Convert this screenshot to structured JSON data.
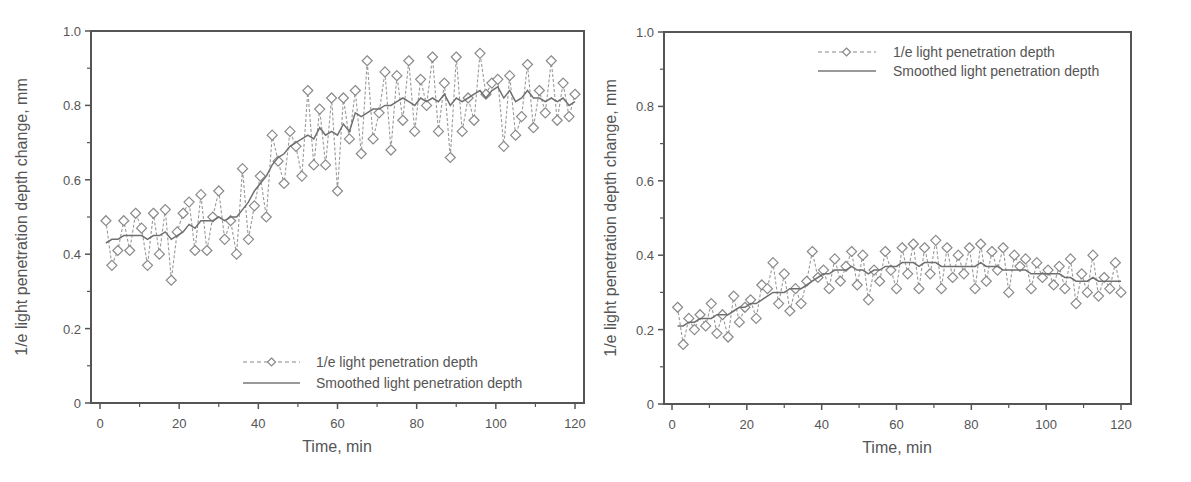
{
  "chart_data": [
    {
      "type": "line",
      "title": "",
      "xlabel": "Time, min",
      "ylabel": "1/e light penetration depth change, mm",
      "xlim": [
        -2,
        122
      ],
      "ylim": [
        0,
        1.0
      ],
      "x_ticks": [
        "0",
        "20",
        "40",
        "60",
        "80",
        "100",
        "120"
      ],
      "y_ticks": [
        "0",
        "0.2",
        "0.4",
        "0.6",
        "0.8",
        "1.0"
      ],
      "grid": false,
      "legend_position": "bottom-right",
      "legend": [
        "1/e light penetration depth",
        "Smoothed light penetration depth"
      ],
      "series": [
        {
          "name": "1/e light penetration depth",
          "style": "dashed-diamond",
          "x": [
            1.5,
            3,
            4.5,
            6,
            7.5,
            9,
            10.5,
            12,
            13.5,
            15,
            16.5,
            18,
            19.5,
            21,
            22.5,
            24,
            25.5,
            27,
            28.5,
            30,
            31.5,
            33,
            34.5,
            36,
            37.5,
            39,
            40.5,
            42,
            43.5,
            45,
            46.5,
            48,
            49.5,
            51,
            52.5,
            54,
            55.5,
            57,
            58.5,
            60,
            61.5,
            63,
            64.5,
            66,
            67.5,
            69,
            70.5,
            72,
            73.5,
            75,
            76.5,
            78,
            79.5,
            81,
            82.5,
            84,
            85.5,
            87,
            88.5,
            90,
            91.5,
            93,
            94.5,
            96,
            97.5,
            99,
            100.5,
            102,
            103.5,
            105,
            106.5,
            108,
            109.5,
            111,
            112.5,
            114,
            115.5,
            117,
            118.5,
            120
          ],
          "values": [
            0.49,
            0.37,
            0.41,
            0.49,
            0.41,
            0.51,
            0.47,
            0.37,
            0.51,
            0.4,
            0.52,
            0.33,
            0.46,
            0.51,
            0.54,
            0.41,
            0.56,
            0.41,
            0.5,
            0.57,
            0.44,
            0.49,
            0.4,
            0.63,
            0.44,
            0.53,
            0.61,
            0.5,
            0.72,
            0.65,
            0.59,
            0.73,
            0.69,
            0.61,
            0.84,
            0.64,
            0.79,
            0.64,
            0.82,
            0.57,
            0.82,
            0.71,
            0.84,
            0.67,
            0.92,
            0.71,
            0.78,
            0.89,
            0.68,
            0.88,
            0.76,
            0.92,
            0.73,
            0.87,
            0.8,
            0.93,
            0.73,
            0.86,
            0.66,
            0.93,
            0.73,
            0.82,
            0.76,
            0.94,
            0.83,
            0.86,
            0.87,
            0.69,
            0.88,
            0.72,
            0.77,
            0.91,
            0.74,
            0.84,
            0.78,
            0.92,
            0.76,
            0.86,
            0.77,
            0.83
          ]
        },
        {
          "name": "Smoothed light penetration depth",
          "style": "solid",
          "x": [
            1.5,
            3,
            4.5,
            6,
            7.5,
            9,
            10.5,
            12,
            13.5,
            15,
            16.5,
            18,
            19.5,
            21,
            22.5,
            24,
            25.5,
            27,
            28.5,
            30,
            31.5,
            33,
            34.5,
            36,
            37.5,
            39,
            40.5,
            42,
            43.5,
            45,
            46.5,
            48,
            49.5,
            51,
            52.5,
            54,
            55.5,
            57,
            58.5,
            60,
            61.5,
            63,
            64.5,
            66,
            67.5,
            69,
            70.5,
            72,
            73.5,
            75,
            76.5,
            78,
            79.5,
            81,
            82.5,
            84,
            85.5,
            87,
            88.5,
            90,
            91.5,
            93,
            94.5,
            96,
            97.5,
            99,
            100.5,
            102,
            103.5,
            105,
            106.5,
            108,
            109.5,
            111,
            112.5,
            114,
            115.5,
            117,
            118.5,
            120
          ],
          "values": [
            0.43,
            0.44,
            0.44,
            0.45,
            0.45,
            0.45,
            0.45,
            0.44,
            0.45,
            0.45,
            0.46,
            0.44,
            0.45,
            0.46,
            0.48,
            0.47,
            0.49,
            0.49,
            0.49,
            0.5,
            0.49,
            0.5,
            0.5,
            0.52,
            0.54,
            0.57,
            0.59,
            0.61,
            0.64,
            0.66,
            0.67,
            0.69,
            0.7,
            0.71,
            0.72,
            0.71,
            0.74,
            0.72,
            0.73,
            0.72,
            0.75,
            0.73,
            0.78,
            0.77,
            0.78,
            0.79,
            0.79,
            0.8,
            0.8,
            0.81,
            0.82,
            0.81,
            0.8,
            0.82,
            0.81,
            0.82,
            0.81,
            0.83,
            0.8,
            0.82,
            0.81,
            0.82,
            0.83,
            0.84,
            0.82,
            0.84,
            0.85,
            0.82,
            0.84,
            0.81,
            0.82,
            0.84,
            0.82,
            0.82,
            0.81,
            0.82,
            0.81,
            0.82,
            0.8,
            0.81
          ]
        }
      ]
    },
    {
      "type": "line",
      "title": "",
      "xlabel": "Time, min",
      "ylabel": "1/e light penetration depth change, mm",
      "xlim": [
        -2,
        122
      ],
      "ylim": [
        0,
        1.0
      ],
      "x_ticks": [
        "0",
        "20",
        "40",
        "60",
        "80",
        "100",
        "120"
      ],
      "y_ticks": [
        "0",
        "0.2",
        "0.4",
        "0.6",
        "0.8",
        "1.0"
      ],
      "grid": false,
      "legend_position": "top-right",
      "legend": [
        "1/e light penetration depth",
        "Smoothed light penetration depth"
      ],
      "series": [
        {
          "name": "1/e light penetration depth",
          "style": "dashed-diamond",
          "x": [
            1.5,
            3,
            4.5,
            6,
            7.5,
            9,
            10.5,
            12,
            13.5,
            15,
            16.5,
            18,
            19.5,
            21,
            22.5,
            24,
            25.5,
            27,
            28.5,
            30,
            31.5,
            33,
            34.5,
            36,
            37.5,
            39,
            40.5,
            42,
            43.5,
            45,
            46.5,
            48,
            49.5,
            51,
            52.5,
            54,
            55.5,
            57,
            58.5,
            60,
            61.5,
            63,
            64.5,
            66,
            67.5,
            69,
            70.5,
            72,
            73.5,
            75,
            76.5,
            78,
            79.5,
            81,
            82.5,
            84,
            85.5,
            87,
            88.5,
            90,
            91.5,
            93,
            94.5,
            96,
            97.5,
            99,
            100.5,
            102,
            103.5,
            105,
            106.5,
            108,
            109.5,
            111,
            112.5,
            114,
            115.5,
            117,
            118.5,
            120
          ],
          "values": [
            0.26,
            0.16,
            0.23,
            0.2,
            0.24,
            0.21,
            0.27,
            0.19,
            0.24,
            0.18,
            0.29,
            0.22,
            0.26,
            0.28,
            0.23,
            0.32,
            0.31,
            0.38,
            0.27,
            0.35,
            0.25,
            0.31,
            0.27,
            0.33,
            0.41,
            0.34,
            0.36,
            0.31,
            0.39,
            0.33,
            0.37,
            0.41,
            0.32,
            0.4,
            0.28,
            0.36,
            0.33,
            0.41,
            0.36,
            0.31,
            0.42,
            0.35,
            0.43,
            0.31,
            0.42,
            0.35,
            0.44,
            0.31,
            0.42,
            0.34,
            0.4,
            0.35,
            0.42,
            0.31,
            0.43,
            0.33,
            0.41,
            0.36,
            0.42,
            0.3,
            0.4,
            0.37,
            0.39,
            0.31,
            0.38,
            0.34,
            0.36,
            0.32,
            0.37,
            0.31,
            0.39,
            0.27,
            0.35,
            0.3,
            0.4,
            0.29,
            0.34,
            0.31,
            0.38,
            0.3
          ]
        },
        {
          "name": "Smoothed light penetration depth",
          "style": "solid",
          "x": [
            1.5,
            3,
            4.5,
            6,
            7.5,
            9,
            10.5,
            12,
            13.5,
            15,
            16.5,
            18,
            19.5,
            21,
            22.5,
            24,
            25.5,
            27,
            28.5,
            30,
            31.5,
            33,
            34.5,
            36,
            37.5,
            39,
            40.5,
            42,
            43.5,
            45,
            46.5,
            48,
            49.5,
            51,
            52.5,
            54,
            55.5,
            57,
            58.5,
            60,
            61.5,
            63,
            64.5,
            66,
            67.5,
            69,
            70.5,
            72,
            73.5,
            75,
            76.5,
            78,
            79.5,
            81,
            82.5,
            84,
            85.5,
            87,
            88.5,
            90,
            91.5,
            93,
            94.5,
            96,
            97.5,
            99,
            100.5,
            102,
            103.5,
            105,
            106.5,
            108,
            109.5,
            111,
            112.5,
            114,
            115.5,
            117,
            118.5,
            120
          ],
          "values": [
            0.21,
            0.21,
            0.22,
            0.22,
            0.23,
            0.23,
            0.23,
            0.24,
            0.24,
            0.24,
            0.25,
            0.26,
            0.26,
            0.27,
            0.27,
            0.28,
            0.29,
            0.3,
            0.3,
            0.3,
            0.31,
            0.31,
            0.31,
            0.32,
            0.33,
            0.34,
            0.35,
            0.35,
            0.36,
            0.36,
            0.36,
            0.37,
            0.36,
            0.36,
            0.35,
            0.36,
            0.36,
            0.37,
            0.37,
            0.37,
            0.38,
            0.38,
            0.38,
            0.37,
            0.38,
            0.38,
            0.38,
            0.37,
            0.37,
            0.37,
            0.37,
            0.37,
            0.37,
            0.37,
            0.38,
            0.37,
            0.37,
            0.37,
            0.36,
            0.36,
            0.36,
            0.36,
            0.36,
            0.35,
            0.35,
            0.35,
            0.35,
            0.35,
            0.35,
            0.34,
            0.34,
            0.33,
            0.33,
            0.33,
            0.34,
            0.33,
            0.33,
            0.33,
            0.33,
            0.33
          ]
        }
      ]
    }
  ]
}
